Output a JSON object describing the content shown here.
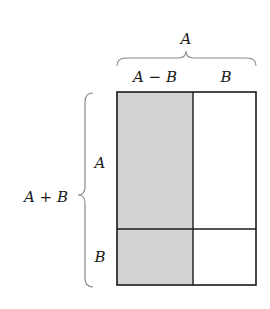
{
  "diagram": {
    "top_brace_label": "A",
    "column_labels": [
      "A − B",
      "B"
    ],
    "left_brace_label": "A + B",
    "row_labels": [
      "A",
      "B"
    ],
    "colors": {
      "shaded_fill": "#d3d3d3",
      "unshaded_fill": "#ffffff",
      "outline": "#1a1a1a",
      "brace": "#8a8a8a"
    },
    "regions": [
      {
        "name": "A-B by A",
        "shaded": true
      },
      {
        "name": "B by A",
        "shaded": false
      },
      {
        "name": "A-B by B",
        "shaded": true
      },
      {
        "name": "B by B",
        "shaded": false
      }
    ]
  }
}
